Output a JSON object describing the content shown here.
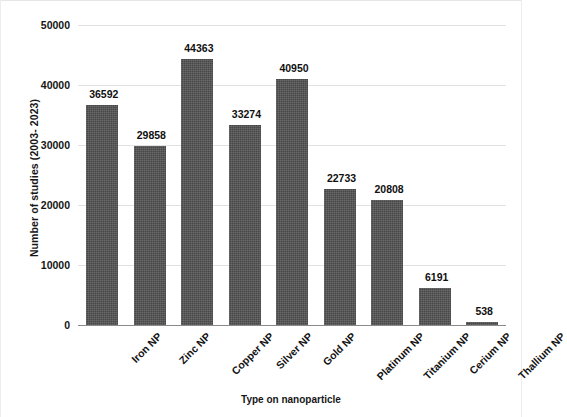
{
  "chart_data": {
    "type": "bar",
    "title": "",
    "xlabel": "Type on nanoparticle",
    "ylabel": "Number of studies (2003- 2023)",
    "categories": [
      "Iron NP",
      "Zinc NP",
      "Copper NP",
      "Silver NP",
      "Gold NP",
      "Platinum NP",
      "Titanium NP",
      "Cerium NP",
      "Thallium NP"
    ],
    "values": [
      36592,
      29858,
      44363,
      33274,
      40950,
      22733,
      20808,
      6191,
      538
    ],
    "data_labels": [
      "36592",
      "29858",
      "44363",
      "33274",
      "40950",
      "22733",
      "20808",
      "6191",
      "538"
    ],
    "ylim": [
      0,
      50000
    ],
    "yticks": [
      0,
      10000,
      20000,
      30000,
      40000,
      50000
    ],
    "ytick_labels": [
      "0",
      "10000",
      "20000",
      "30000",
      "40000",
      "50000"
    ],
    "grid": true,
    "legend": false,
    "bar_color": "#474747",
    "gridline_color": "#e2e2e2",
    "axis_color": "#8a8a8a"
  },
  "axes": {
    "y_title": "Number of studies (2003- 2023)",
    "x_title": "Type on nanoparticle"
  }
}
